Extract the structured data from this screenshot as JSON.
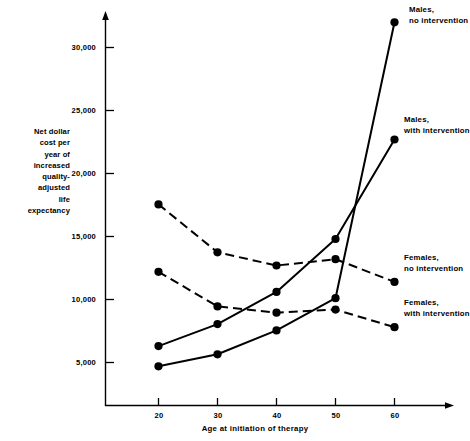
{
  "chart_data": {
    "type": "line",
    "title": "",
    "xlabel": "Age at initiation of therapy",
    "ylabel": "Net dollar cost per year of increased quality-adjusted life expectancy",
    "ylabel_lines": [
      "Net dollar",
      "cost per",
      "year of",
      "increased",
      "quality-",
      "adjusted",
      "life",
      "expectancy"
    ],
    "x": [
      20,
      30,
      40,
      50,
      60
    ],
    "xtick_labels": [
      "20",
      "30",
      "40",
      "50",
      "60"
    ],
    "ytick_labels": [
      "5,000",
      "10,000",
      "15,000",
      "20,000",
      "25,000",
      "30,000"
    ],
    "ytick_values": [
      5000,
      10000,
      15000,
      20000,
      25000,
      30000
    ],
    "xlim": [
      14,
      66
    ],
    "ylim": [
      0,
      33500
    ],
    "grid": false,
    "legend_position": "right-inline",
    "series": [
      {
        "name": "Males, no intervention",
        "label_lines": [
          "Males,",
          "no intervention"
        ],
        "style": "solid",
        "color": "#000000",
        "marker": "circle",
        "values": [
          4700,
          5650,
          7550,
          10100,
          32000
        ]
      },
      {
        "name": "Males, with intervention",
        "label_lines": [
          "Males,",
          "with intervention"
        ],
        "style": "solid",
        "color": "#000000",
        "marker": "circle",
        "values": [
          6300,
          8050,
          10600,
          14800,
          22700
        ]
      },
      {
        "name": "Females, no intervention",
        "label_lines": [
          "Females,",
          "no intervention"
        ],
        "style": "dashed",
        "color": "#000000",
        "marker": "circle",
        "values": [
          17550,
          13750,
          12700,
          13200,
          11400
        ]
      },
      {
        "name": "Females, with intervention",
        "label_lines": [
          "Females,",
          "with intervention"
        ],
        "style": "dashed",
        "color": "#000000",
        "marker": "circle",
        "values": [
          12200,
          9450,
          8950,
          9200,
          7800
        ]
      }
    ]
  },
  "axes": {
    "x_tick_0": "20",
    "x_tick_1": "30",
    "x_tick_2": "40",
    "x_tick_3": "50",
    "x_tick_4": "60",
    "y_tick_0": "5,000",
    "y_tick_1": "10,000",
    "y_tick_2": "15,000",
    "y_tick_3": "20,000",
    "y_tick_4": "25,000",
    "y_tick_5": "30,000"
  },
  "labels": {
    "xaxis_title": "Age at initiation of therapy",
    "ylabel_l0": "Net dollar",
    "ylabel_l1": "cost per",
    "ylabel_l2": "year of",
    "ylabel_l3": "increased",
    "ylabel_l4": "quality-",
    "ylabel_l5": "adjusted",
    "ylabel_l6": "life",
    "ylabel_l7": "expectancy",
    "males_no_l0": "Males,",
    "males_no_l1": "no intervention",
    "males_with_l0": "Males,",
    "males_with_l1": "with intervention",
    "females_no_l0": "Females,",
    "females_no_l1": "no intervention",
    "females_with_l0": "Females,",
    "females_with_l1": "with intervention"
  }
}
